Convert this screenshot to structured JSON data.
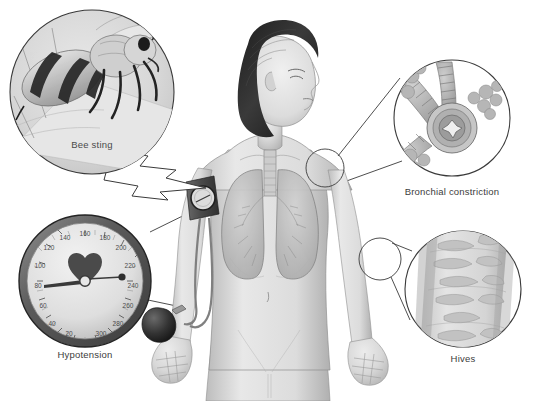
{
  "figure": {
    "background_color": "#ffffff",
    "line_color": "#3a3a3a",
    "skin_color": "#d9d9d9",
    "hair_color": "#2b2b2b",
    "organ_color": "#c4c4c4"
  },
  "callouts": [
    {
      "id": "bee-sting",
      "label": "Bee sting",
      "position": "top-left",
      "shape": "circle",
      "center_x": 92,
      "center_y": 92,
      "radius": 82,
      "label_x": 92,
      "label_y": 146,
      "pointer": "jagged-burst-arrow",
      "points_to": "right shoulder",
      "contents": "close-up of a honeybee stinging skin"
    },
    {
      "id": "bronchial-constriction",
      "label": "Bronchial constriction",
      "position": "top-right",
      "shape": "circle",
      "center_x": 452,
      "center_y": 118,
      "radius": 58,
      "label_x": 452,
      "label_y": 192,
      "pointer": "tangent-leader-lines",
      "points_to": "left lung",
      "source_x": 325,
      "source_y": 168,
      "source_r": 19,
      "contents": "bronchioles with alveolar clusters and a narrowed airway cross-section"
    },
    {
      "id": "hypotension",
      "label": "Hypotension",
      "position": "bottom-left",
      "shape": "circle",
      "center_x": 85,
      "center_y": 281,
      "radius": 66,
      "label_x": 85,
      "label_y": 355,
      "pointer": "tangent-leader-lines",
      "points_to": "blood pressure cuff on arm",
      "contents": "sphygmomanometer dial reading low"
    },
    {
      "id": "hives",
      "label": "Hives",
      "position": "bottom-right",
      "shape": "circle",
      "center_x": 463,
      "center_y": 289,
      "radius": 58,
      "label_x": 463,
      "label_y": 359,
      "pointer": "tangent-leader-lines",
      "points_to": "right forearm",
      "source_x": 380,
      "source_y": 259,
      "source_r": 21,
      "contents": "raised urticarial welts on skin"
    }
  ],
  "gauge": {
    "name": "sphygmomanometer",
    "tick_labels": [
      "20",
      "40",
      "60",
      "80",
      "100",
      "120",
      "140",
      "160",
      "180",
      "200",
      "220",
      "240",
      "260",
      "280",
      "300"
    ],
    "center_icon": "heart-icon",
    "needle_reading": "low",
    "bezel_color": "#6e6e6e",
    "face_color": "#e2e2e2"
  },
  "equipment": {
    "cuff": "blood-pressure-cuff",
    "bulb": "inflation-bulb",
    "tubing": "rubber-tubing",
    "cuff_gauge": "small-dial-gauge"
  },
  "anatomy": {
    "trachea": "trachea",
    "right_lung": "right-lung",
    "left_lung": "left-lung",
    "navel": "navel"
  }
}
